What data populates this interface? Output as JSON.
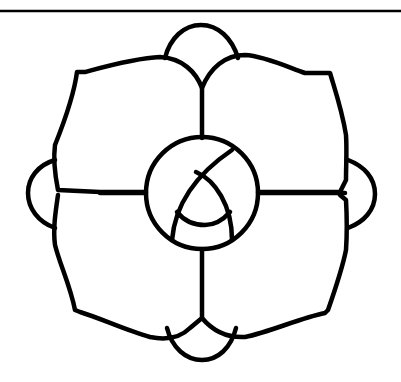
{
  "figure": {
    "colors": {
      "line": "#000000",
      "background": "#ffffff"
    },
    "top_rule": {
      "y": 11
    },
    "center": {
      "cx": 202,
      "cy": 193,
      "r": 56
    },
    "petals": [
      "top-left-petal",
      "top-right-petal",
      "bottom-left-petal",
      "bottom-right-petal"
    ],
    "bumps": [
      "top-bump",
      "bottom-bump",
      "left-bump",
      "right-bump"
    ],
    "inner_knot": "three interlocking arcs inside center circle"
  }
}
